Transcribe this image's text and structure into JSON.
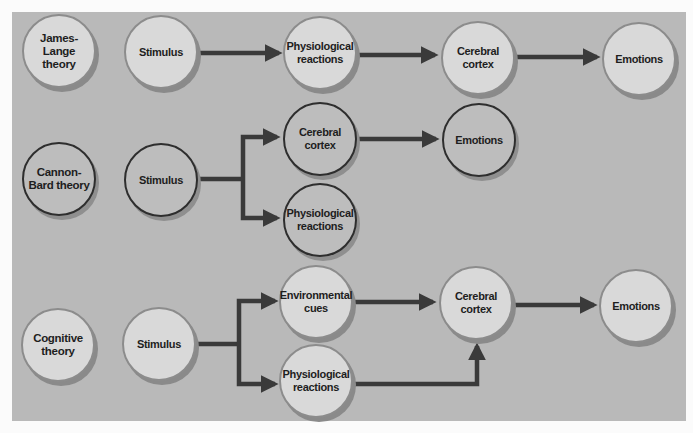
{
  "diagram": {
    "colors": {
      "panel_bg": "#b9b9b9",
      "node_fill_light": "#d9d9d9",
      "node_fill_dark": "#bdbdbd",
      "arrow": "#3a3a3a"
    },
    "rows": [
      {
        "theory": "James-Lange theory",
        "nodes": {
          "stimulus": "Stimulus",
          "physiological": "Physiological reactions",
          "cortex": "Cerebral cortex",
          "emotions": "Emotions"
        },
        "flow": [
          "Stimulus",
          "Physiological reactions",
          "Cerebral cortex",
          "Emotions"
        ]
      },
      {
        "theory": "Cannon-Bard theory",
        "nodes": {
          "stimulus": "Stimulus",
          "cortex": "Cerebral cortex",
          "physiological": "Physiological reactions",
          "emotions": "Emotions"
        },
        "flow": [
          "Stimulus → Cerebral cortex → Emotions",
          "Stimulus → Physiological reactions"
        ]
      },
      {
        "theory": "Cognitive theory",
        "nodes": {
          "stimulus": "Stimulus",
          "environmental": "Environmental cues",
          "physiological": "Physiological reactions",
          "cortex": "Cerebral cortex",
          "emotions": "Emotions"
        },
        "flow": [
          "Stimulus → Environmental cues → Cerebral cortex",
          "Stimulus → Physiological reactions → Cerebral cortex",
          "Cerebral cortex → Emotions"
        ]
      }
    ]
  }
}
